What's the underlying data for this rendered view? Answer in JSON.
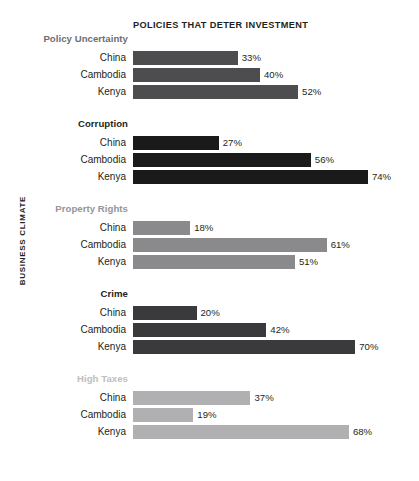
{
  "chart_data": {
    "type": "bar",
    "orientation": "horizontal",
    "title": "POLICIES THAT DETER INVESTMENT",
    "ylabel": "BUSINESS CLIMATE",
    "xlabel": "",
    "grid": false,
    "legend": "none",
    "xlim": [
      0,
      74
    ],
    "value_suffix": "%",
    "categories": [
      "China",
      "Cambodia",
      "Kenya"
    ],
    "groups": [
      {
        "name": "Policy Uncertainty",
        "color": "#4d4d4f",
        "label_color": "#6d6e71",
        "values": [
          33,
          37,
          52
        ],
        "labels": [
          "33%",
          "40%",
          "52%"
        ],
        "points": [
          {
            "category": "China",
            "value": 33,
            "label": "33%"
          },
          {
            "category": "Cambodia",
            "value": 40,
            "label": "40%"
          },
          {
            "category": "Kenya",
            "value": 52,
            "label": "52%"
          }
        ]
      },
      {
        "name": "Corruption",
        "color": "#1a1a1a",
        "label_color": "#231f20",
        "values": [
          27,
          56,
          74
        ],
        "labels": [
          "27%",
          "56%",
          "74%"
        ],
        "points": [
          {
            "category": "China",
            "value": 27,
            "label": "27%"
          },
          {
            "category": "Cambodia",
            "value": 56,
            "label": "56%"
          },
          {
            "category": "Kenya",
            "value": 74,
            "label": "74%"
          }
        ]
      },
      {
        "name": "Property Rights",
        "color": "#8a8a8c",
        "label_color": "#939598",
        "values": [
          18,
          61,
          51
        ],
        "labels": [
          "18%",
          "61%",
          "51%"
        ],
        "points": [
          {
            "category": "China",
            "value": 18,
            "label": "18%"
          },
          {
            "category": "Cambodia",
            "value": 61,
            "label": "61%"
          },
          {
            "category": "Kenya",
            "value": 51,
            "label": "51%"
          }
        ]
      },
      {
        "name": "Crime",
        "color": "#3a3a3c",
        "label_color": "#231f20",
        "values": [
          20,
          42,
          70
        ],
        "labels": [
          "20%",
          "42%",
          "70%"
        ],
        "points": [
          {
            "category": "China",
            "value": 20,
            "label": "20%"
          },
          {
            "category": "Cambodia",
            "value": 42,
            "label": "42%"
          },
          {
            "category": "Kenya",
            "value": 70,
            "label": "70%"
          }
        ]
      },
      {
        "name": "High Taxes",
        "color": "#b0b0b2",
        "label_color": "#bcbec0",
        "values": [
          37,
          19,
          68
        ],
        "labels": [
          "37%",
          "19%",
          "68%"
        ],
        "points": [
          {
            "category": "China",
            "value": 37,
            "label": "37%"
          },
          {
            "category": "Cambodia",
            "value": 19,
            "label": "19%"
          },
          {
            "category": "Kenya",
            "value": 68,
            "label": "68%"
          }
        ]
      }
    ]
  },
  "layout": {
    "bar_origin_x": 133,
    "px_per_percent": 3.175,
    "bar_height": 14,
    "row_pitch": 17,
    "group_label_offset": 18,
    "group_tops": [
      33,
      118,
      203,
      288,
      373
    ],
    "value_gap": 4
  }
}
